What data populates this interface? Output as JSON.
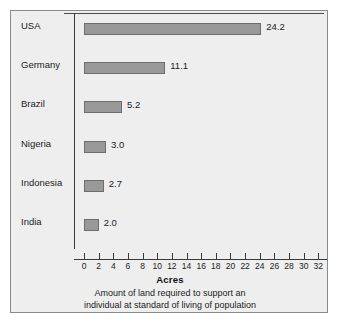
{
  "chart_data": {
    "type": "bar",
    "orientation": "horizontal",
    "title": "",
    "xlabel": "Acres",
    "ylabel": "",
    "xlim": [
      0,
      34
    ],
    "xticks": [
      0,
      2,
      4,
      6,
      8,
      10,
      12,
      14,
      16,
      18,
      20,
      22,
      24,
      26,
      28,
      30,
      32,
      34
    ],
    "grid": false,
    "legend": null,
    "categories": [
      "USA",
      "Germany",
      "Brazil",
      "Nigeria",
      "Indonesia",
      "India"
    ],
    "values": [
      24.2,
      11.1,
      5.2,
      3.0,
      2.7,
      2.0
    ],
    "value_labels": [
      "24.2",
      "11.1",
      "5.2",
      "3.0",
      "2.7",
      "2.0"
    ],
    "bars": [
      {
        "category": "USA",
        "value": 24.2,
        "label": "24.2"
      },
      {
        "category": "Germany",
        "value": 11.1,
        "label": "11.1"
      },
      {
        "category": "Brazil",
        "value": 5.2,
        "label": "5.2"
      },
      {
        "category": "Nigeria",
        "value": 3.0,
        "label": "3.0"
      },
      {
        "category": "Indonesia",
        "value": 2.7,
        "label": "2.7"
      },
      {
        "category": "India",
        "value": 2.0,
        "label": "2.0"
      }
    ],
    "caption_lines": [
      "Amount of land required to support an",
      "individual at standard of living of population"
    ],
    "colors": {
      "bar_fill": "#999999",
      "bar_stroke": "#6d6d6d",
      "figure_background": "#eeeeee",
      "figure_border": "#8a8a8a",
      "axis": "#3a3a3a",
      "text": "#1b1b1b"
    }
  }
}
